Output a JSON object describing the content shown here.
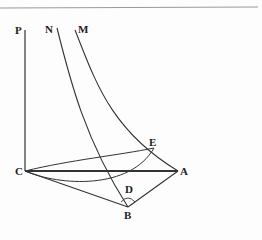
{
  "figure": {
    "background": "#fdfdfd",
    "line_color": "#333333",
    "labels": {
      "P": "P",
      "N": "N",
      "M": "M",
      "E": "E",
      "C": "C",
      "A": "A",
      "D": "D",
      "B": "B"
    },
    "points": {
      "C": [
        25,
        171
      ],
      "A": [
        178,
        171
      ],
      "E": [
        154,
        148
      ],
      "B": [
        128,
        207
      ],
      "P_top": [
        25,
        30
      ],
      "N_top": [
        57,
        28
      ],
      "M_top": [
        75,
        30
      ]
    }
  }
}
